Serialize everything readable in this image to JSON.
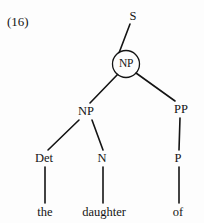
{
  "figure": {
    "example_number": "(16)",
    "type": "syntax-tree",
    "ink_color": "#141414",
    "background_color": "#fdfdfd",
    "circle_highlight_color": "#141414"
  },
  "tree": {
    "nodes": [
      {
        "id": "s",
        "label": "S",
        "x": 133,
        "y": 16,
        "circled": false
      },
      {
        "id": "np-top",
        "label": "NP",
        "x": 126,
        "y": 64,
        "circled": true
      },
      {
        "id": "np-lower",
        "label": "NP",
        "x": 86,
        "y": 111,
        "circled": false
      },
      {
        "id": "pp",
        "label": "PP",
        "x": 181,
        "y": 109,
        "circled": false
      },
      {
        "id": "det",
        "label": "Det",
        "x": 44,
        "y": 158,
        "circled": false
      },
      {
        "id": "n",
        "label": "N",
        "x": 102,
        "y": 158,
        "circled": false
      },
      {
        "id": "p",
        "label": "P",
        "x": 178,
        "y": 158,
        "circled": false
      }
    ],
    "terminals": [
      {
        "id": "the",
        "label": "the",
        "x": 45,
        "y": 212
      },
      {
        "id": "daughter",
        "label": "daughter",
        "x": 104,
        "y": 212
      },
      {
        "id": "of",
        "label": "of",
        "x": 178,
        "y": 212
      }
    ],
    "edges": [
      {
        "id": "s-np",
        "from": "s",
        "to": "np-top",
        "x1": 130,
        "y1": 24,
        "x2": 119,
        "y2": 53
      },
      {
        "id": "np-nplower",
        "from": "np-top",
        "to": "np-lower",
        "x1": 118,
        "y1": 74,
        "x2": 90,
        "y2": 103
      },
      {
        "id": "np-pp",
        "from": "np-top",
        "to": "pp",
        "x1": 136,
        "y1": 73,
        "x2": 175,
        "y2": 101
      },
      {
        "id": "nplower-det",
        "from": "np-lower",
        "to": "det",
        "x1": 79,
        "y1": 120,
        "x2": 48,
        "y2": 150
      },
      {
        "id": "nplower-n",
        "from": "np-lower",
        "to": "n",
        "x1": 92,
        "y1": 120,
        "x2": 103,
        "y2": 150
      },
      {
        "id": "pp-p",
        "from": "pp",
        "to": "p",
        "x1": 180,
        "y1": 118,
        "x2": 179,
        "y2": 150
      },
      {
        "id": "det-the",
        "from": "det",
        "to": "the",
        "x1": 45,
        "y1": 167,
        "x2": 45,
        "y2": 203
      },
      {
        "id": "n-daughter",
        "from": "n",
        "to": "daughter",
        "x1": 103,
        "y1": 167,
        "x2": 103,
        "y2": 203
      },
      {
        "id": "p-of",
        "from": "p",
        "to": "of",
        "x1": 179,
        "y1": 167,
        "x2": 179,
        "y2": 203
      }
    ],
    "circle": {
      "cx": 126,
      "cy": 64,
      "r": 13.5
    }
  }
}
